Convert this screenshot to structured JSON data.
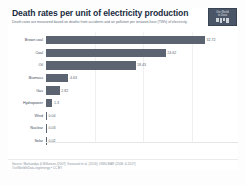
{
  "chart_data": {
    "type": "bar",
    "title": "Death rates per unit of electricity production",
    "subtitle": "Death rates are measured based on deaths from accidents and air pollution per terawatt-hour (TWh) of electricity.",
    "categories": [
      "Brown coal",
      "Coal",
      "Oil",
      "Biomass",
      "Gas",
      "Hydropower",
      "Wind",
      "Nuclear",
      "Solar"
    ],
    "values": [
      32.72,
      24.62,
      18.43,
      4.63,
      2.82,
      1.3,
      0.04,
      0.03,
      0.02
    ],
    "value_labels": [
      "32.72",
      "24.62",
      "18.43",
      "4.63",
      "2.82",
      "1.3",
      "0.04",
      "0.03",
      "0.02"
    ],
    "xlabel": "",
    "ylabel": "",
    "xlim": [
      0,
      35
    ],
    "gridlines": [
      10,
      20,
      30
    ],
    "orientation": "horizontal",
    "grid": true,
    "legend": "none",
    "bar_color": "#5b6470"
  },
  "branding": {
    "logo_line1": "Our World",
    "logo_line2": "in Data"
  },
  "footer": {
    "source_line1": "Source: Markandya & Wilkinson (2007); Sovacool et al. (2016); UNSCEAR (2008; & 2017)",
    "source_line2": "OurWorldInData.org/energy • CC BY"
  }
}
